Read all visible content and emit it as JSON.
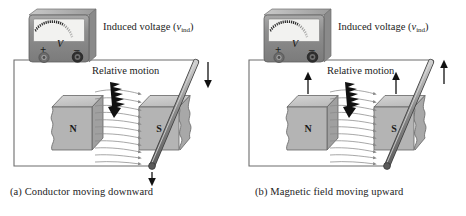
{
  "figure": {
    "background_color": "#ffffff"
  },
  "panels": [
    {
      "id": "a",
      "caption": "(a) Conductor moving downward",
      "labels": {
        "induced_voltage": "Induced voltage (",
        "induced_symbol": "v",
        "induced_subscript": "ind",
        "induced_close": ")",
        "relative_motion": "Relative motion"
      },
      "meter": {
        "unit_label": "V",
        "positive_terminal": "+",
        "negative_terminal": "–",
        "body_color": "#8d8d8d",
        "face_color": "#f2f2f0",
        "needle_count": 22
      },
      "magnets": [
        {
          "pole": "N",
          "side": "left",
          "face_color": "#b2b2b2",
          "top_color": "#cfcfcf"
        },
        {
          "pole": "S",
          "side": "right",
          "face_color": "#b2b2b2",
          "top_color": "#cfcfcf"
        }
      ],
      "motion": {
        "conductor_direction": "down",
        "magnet_direction": "none",
        "arrow_color": "#111111"
      },
      "field_lines": {
        "count": 11,
        "direction": "N-to-S",
        "color": "#8a8a8a"
      }
    },
    {
      "id": "b",
      "caption": "(b) Magnetic field moving upward",
      "labels": {
        "induced_voltage": "Induced voltage (",
        "induced_symbol": "v",
        "induced_subscript": "ind",
        "induced_close": ")",
        "relative_motion": "Relative motion"
      },
      "meter": {
        "unit_label": "V",
        "positive_terminal": "+",
        "negative_terminal": "–",
        "body_color": "#8d8d8d",
        "face_color": "#f2f2f0",
        "needle_count": 22
      },
      "magnets": [
        {
          "pole": "N",
          "side": "left",
          "face_color": "#b2b2b2",
          "top_color": "#cfcfcf"
        },
        {
          "pole": "S",
          "side": "right",
          "face_color": "#b2b2b2",
          "top_color": "#cfcfcf"
        }
      ],
      "motion": {
        "conductor_direction": "none",
        "magnet_direction": "up",
        "arrow_color": "#111111"
      },
      "field_lines": {
        "count": 11,
        "direction": "N-to-S",
        "color": "#8a8a8a"
      }
    }
  ],
  "colors": {
    "wire": "#6d6d6d",
    "rod_dark": "#6f6f6f",
    "rod_light": "#d6d6d6",
    "text": "#1c1c1c"
  }
}
